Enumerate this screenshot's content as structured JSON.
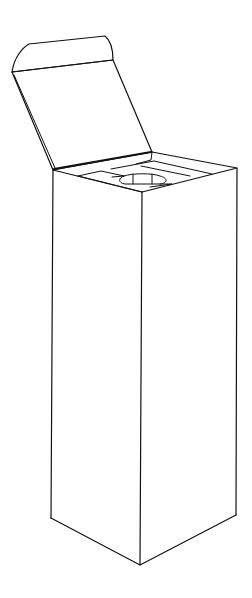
{
  "diagram": {
    "colors": {
      "background": "#ffffff",
      "line": "#111111"
    },
    "parts": [
      "tuck-flap",
      "lid-panel",
      "box-top-opening",
      "insert-with-cutout",
      "left-face",
      "right-face",
      "bottom-edges"
    ]
  }
}
